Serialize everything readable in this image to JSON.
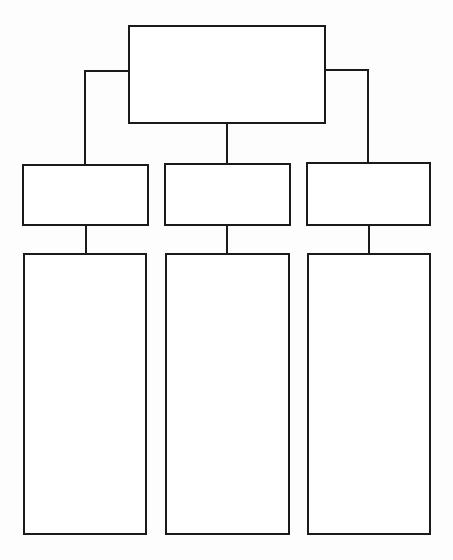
{
  "document": {
    "title": "Blank hierarchy chart template",
    "description": "Empty organizational chart worksheet with one top-level box, three second-level boxes, and three tall third-level boxes",
    "background_color": "#fdfdfd",
    "line_color": "#1a1a1a",
    "box_fill_color": "#ffffff",
    "line_width": 2,
    "canvas_width": 453,
    "canvas_height": 560
  },
  "chart_data": {
    "type": "diagram",
    "subtype": "organizational-hierarchy-tree",
    "title": "",
    "orientation": "top-down",
    "levels": 3,
    "node_count": 7,
    "connector_count": 6,
    "all_nodes_blank": true,
    "nodes": [
      {
        "id": "root",
        "level": 1,
        "label": "",
        "x": 129,
        "y": 26,
        "width": 196,
        "height": 97,
        "shape": "rectangle"
      },
      {
        "id": "branch-left",
        "level": 2,
        "label": "",
        "x": 23,
        "y": 165,
        "width": 125,
        "height": 60,
        "shape": "rectangle",
        "parent": "root"
      },
      {
        "id": "branch-center",
        "level": 2,
        "label": "",
        "x": 165,
        "y": 164,
        "width": 125,
        "height": 61,
        "shape": "rectangle",
        "parent": "root"
      },
      {
        "id": "branch-right",
        "level": 2,
        "label": "",
        "x": 307,
        "y": 163,
        "width": 123,
        "height": 62,
        "shape": "rectangle",
        "parent": "root"
      },
      {
        "id": "leaf-left",
        "level": 3,
        "label": "",
        "x": 24,
        "y": 254,
        "width": 122,
        "height": 280,
        "shape": "rectangle",
        "parent": "branch-left"
      },
      {
        "id": "leaf-center",
        "level": 3,
        "label": "",
        "x": 166,
        "y": 254,
        "width": 123,
        "height": 280,
        "shape": "rectangle",
        "parent": "branch-center"
      },
      {
        "id": "leaf-right",
        "level": 3,
        "label": "",
        "x": 308,
        "y": 254,
        "width": 122,
        "height": 280,
        "shape": "rectangle",
        "parent": "branch-right"
      }
    ],
    "connectors": [
      {
        "id": "root-to-branch-left",
        "from": "root",
        "to": "branch-left",
        "style": "elbow",
        "path": "M 129 71 L 85 71 L 85 165"
      },
      {
        "id": "root-to-branch-center",
        "from": "root",
        "to": "branch-center",
        "style": "straight-vertical",
        "path": "M 227 123 L 227 164"
      },
      {
        "id": "root-to-branch-right",
        "from": "root",
        "to": "branch-right",
        "style": "elbow",
        "path": "M 325 70 L 368 70 L 368 163"
      },
      {
        "id": "branch-left-to-leaf-left",
        "from": "branch-left",
        "to": "leaf-left",
        "style": "straight-vertical",
        "path": "M 86 225 L 86 254"
      },
      {
        "id": "branch-center-to-leaf-center",
        "from": "branch-center",
        "to": "leaf-center",
        "style": "straight-vertical",
        "path": "M 227 225 L 227 254"
      },
      {
        "id": "branch-right-to-leaf-right",
        "from": "branch-right",
        "to": "leaf-right",
        "style": "straight-vertical",
        "path": "M 369 225 L 369 254"
      }
    ]
  }
}
